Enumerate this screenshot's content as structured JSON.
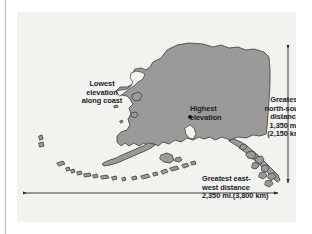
{
  "figure": {
    "type": "thematic reference map with dimension callouts",
    "background_color": "#f2f2f0",
    "land_fill_color": "#9a9a9a",
    "land_outline_color": "#3b3b3b",
    "annotation_text_color": "#1c1c1c",
    "arrow_color": "#2b2b2b",
    "page_rule_color": "#b9b9b9"
  },
  "annotations": {
    "lowest_elevation": {
      "name": "lowest-elevation-callout",
      "text": "Lowest\nelevation\nalong coast",
      "lines": [
        "Lowest",
        "elevation",
        "along coast"
      ]
    },
    "highest_elevation": {
      "name": "highest-elevation-callout",
      "text": "Highest\nelevation",
      "lines": [
        "Highest",
        "elevation"
      ],
      "marker": "filled-dot"
    },
    "north_south": {
      "name": "north-south-distance-callout",
      "text": "Greatest\nnorth-south\ndistance\n1,350 mi.\n(2,150 km)",
      "lines": [
        "Greatest",
        "north-south",
        "distance",
        "1,350 mi.",
        "(2,150 km)"
      ],
      "distance_miles": "1,350 mi.",
      "distance_km": "(2,150 km)"
    },
    "east_west": {
      "name": "east-west-distance-callout",
      "text": "Greatest east-\nwest distance\n2,350 mi.(3,800 km)",
      "lines": [
        "Greatest east-",
        "west distance",
        "2,350 mi.(3,800 km)"
      ],
      "distance_miles": "2,350 mi.",
      "distance_km": "(3,800 km)"
    }
  },
  "measurements": [
    {
      "label": "Greatest north-south distance",
      "miles": 1350,
      "kilometers": 2150,
      "orientation": "vertical",
      "arrow": "double-headed"
    },
    {
      "label": "Greatest east-west distance",
      "miles": 2350,
      "kilometers": 3800,
      "orientation": "horizontal",
      "arrow": "double-headed"
    }
  ],
  "map_features": [
    "Alaska mainland",
    "Seward Peninsula",
    "Alaska Peninsula",
    "Aleutian Island chain",
    "Kodiak Island",
    "Southeast panhandle and islands",
    "offshore western islands"
  ]
}
